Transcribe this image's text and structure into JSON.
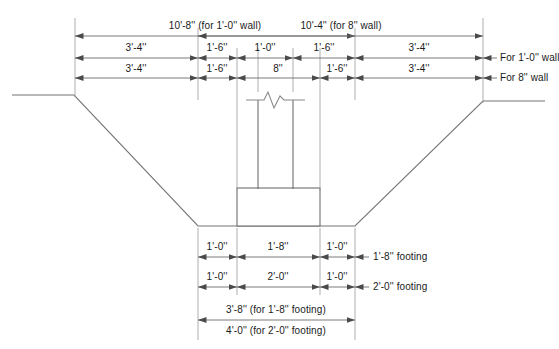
{
  "drawing": {
    "title_context": "foundation-trench-section",
    "line_color": "#555555",
    "dim_line_color": "#6b6b6b",
    "text_color": "#1a1a1a"
  },
  "top_dimensions": {
    "row1": {
      "left_span_label": "10'-8'' (for 1'-0'' wall)",
      "right_span_label": "10'-4'' (for 8'' wall)"
    },
    "row2": {
      "segments": [
        "3'-4''",
        "1'-6''",
        "1'-0''",
        "1'-6''",
        "3'-4''"
      ],
      "note": "For 1'-0'' wall"
    },
    "row3": {
      "segments": [
        "3'-4''",
        "1'-6''",
        "8''",
        "1'-6''",
        "3'-4''"
      ],
      "note": "For 8'' wall"
    }
  },
  "bottom_dimensions": {
    "row1": {
      "segments": [
        "1'-0''",
        "1'-8''",
        "1'-0''"
      ],
      "note": "1'-8'' footing"
    },
    "row2": {
      "segments": [
        "1'-0''",
        "2'-0''",
        "1'-0''"
      ],
      "note": "2'-0'' footing"
    },
    "row3": {
      "label": "3'-8'' (for 1'-8'' footing)"
    },
    "row4": {
      "label": "4'-0'' (for 2'-0'' footing)"
    }
  },
  "elements": {
    "wall_icon": "break-line-symbol",
    "footing_icon": "footing-rectangle",
    "ground_icon": "trench-ground-line"
  }
}
